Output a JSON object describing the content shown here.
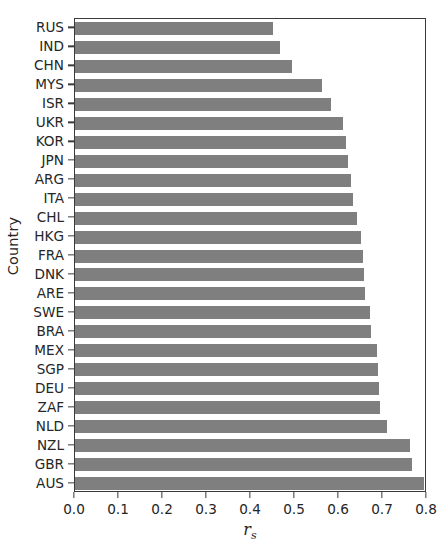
{
  "chart_data": {
    "type": "bar",
    "orientation": "horizontal",
    "title": "",
    "xlabel": "r_s",
    "xlabel_base": "r",
    "xlabel_sub": "s",
    "ylabel": "Country",
    "xlim": [
      0.0,
      0.8
    ],
    "ylim_categories_count": 25,
    "grid": false,
    "legend": null,
    "bar_color": "#7f7f7f",
    "axis_color": "#3a3a3a",
    "xticks": [
      "0.0",
      "0.1",
      "0.2",
      "0.3",
      "0.4",
      "0.5",
      "0.6",
      "0.7",
      "0.8"
    ],
    "xtick_values": [
      0.0,
      0.1,
      0.2,
      0.3,
      0.4,
      0.5,
      0.6,
      0.7,
      0.8
    ],
    "categories": [
      "RUS",
      "IND",
      "CHN",
      "MYS",
      "ISR",
      "UKR",
      "KOR",
      "JPN",
      "ARG",
      "ITA",
      "CHL",
      "HKG",
      "FRA",
      "DNK",
      "ARE",
      "SWE",
      "BRA",
      "MEX",
      "SGP",
      "DEU",
      "ZAF",
      "NLD",
      "NZL",
      "GBR",
      "AUS"
    ],
    "values": [
      0.45,
      0.466,
      0.494,
      0.562,
      0.581,
      0.609,
      0.616,
      0.621,
      0.628,
      0.631,
      0.642,
      0.649,
      0.654,
      0.656,
      0.659,
      0.671,
      0.673,
      0.687,
      0.689,
      0.692,
      0.694,
      0.708,
      0.762,
      0.765,
      0.794
    ]
  }
}
